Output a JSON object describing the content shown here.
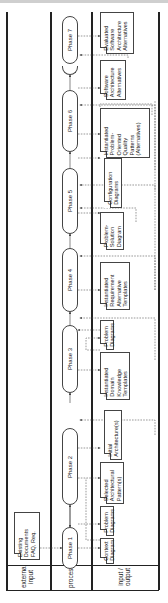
{
  "lanes": [
    {
      "id": "external",
      "label_line1": "external",
      "label_line2": "input"
    },
    {
      "id": "process",
      "label_line1": "process",
      "label_line2": ""
    },
    {
      "id": "io",
      "label_line1": "input /",
      "label_line2": "output"
    }
  ],
  "phases": [
    {
      "label": "Phase 1"
    },
    {
      "label": "Phase 2"
    },
    {
      "label": "Phase 3"
    },
    {
      "label": "Phase 4"
    },
    {
      "label": "Phase 5"
    },
    {
      "label": "Phase 6"
    },
    {
      "label": "Phase 7"
    },
    {
      "label": "Phase 8"
    }
  ],
  "external_inputs": [
    {
      "text": "Existing\nDocuments\nFAQ, Req."
    }
  ],
  "artifacts": [
    {
      "text": "Context\nDiagram"
    },
    {
      "text": "Problem\nDiagrams"
    },
    {
      "text": "Selected\nArchitectural\nPattern(s)"
    },
    {
      "text": "Initial\nArchitecture(s)"
    },
    {
      "text": "Instantiated\nDomain\nKnowledge\nTemplates"
    },
    {
      "text": "Problem\nDiagrams"
    },
    {
      "text": "Instantiated\nRequirement\nAlternative\nTemplates"
    },
    {
      "text": "Problem-\nSolution\nDiagram"
    },
    {
      "text": "Configuration\nDiagrams"
    },
    {
      "text": "Instantiated\nProblem-\nOriented\nQuality\nPatterns\n(Alternatives)"
    },
    {
      "text": "Software\nArchitecture\nAlternatives"
    },
    {
      "text": "Evaluated\nSoftware\nArchitecture\nAlternatives"
    }
  ]
}
